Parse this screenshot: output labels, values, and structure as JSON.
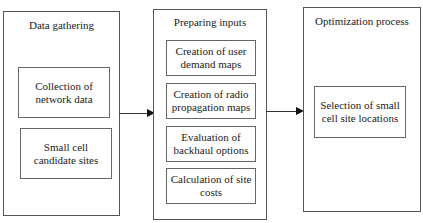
{
  "diagram": {
    "stages": [
      {
        "title": "Data gathering",
        "steps": [
          "Collection of network data",
          "Small cell candidate sites"
        ]
      },
      {
        "title": "Preparing inputs",
        "steps": [
          "Creation of user demand maps",
          "Creation of radio propagation maps",
          "Evaluation of backhaul options",
          "Calculation of site costs"
        ]
      },
      {
        "title": "Optimization process",
        "steps": [
          "Selection of small cell site locations"
        ]
      }
    ],
    "connections": [
      {
        "from": "Data gathering",
        "to": "Preparing inputs"
      },
      {
        "from": "Preparing inputs",
        "to": "Optimization process"
      }
    ]
  }
}
